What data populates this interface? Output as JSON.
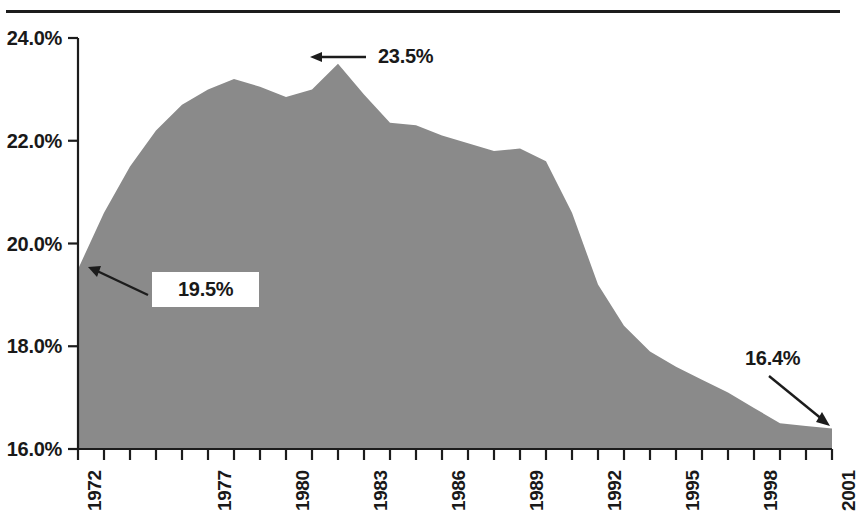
{
  "chart_data": {
    "type": "area",
    "title": "",
    "subtitle": "",
    "xlabel": "",
    "ylabel": "",
    "ylim": [
      16.0,
      24.0
    ],
    "xlim": [
      1972,
      2001
    ],
    "grid": false,
    "legend": null,
    "y_tick_labels": [
      "24.0%",
      "22.0%",
      "20.0%",
      "18.0%",
      "16.0%"
    ],
    "y_tick_values": [
      24.0,
      22.0,
      20.0,
      18.0,
      16.0
    ],
    "x_tick_labels_shown": [
      "1972",
      "1977",
      "1980",
      "1983",
      "1986",
      "1989",
      "1992",
      "1995",
      "1998",
      "2001"
    ],
    "x_tick_values_shown": [
      1972,
      1977,
      1980,
      1983,
      1986,
      1989,
      1992,
      1995,
      1998,
      2001
    ],
    "x_minor_ticks_every_year": true,
    "x": [
      1972,
      1973,
      1974,
      1975,
      1976,
      1977,
      1978,
      1979,
      1980,
      1981,
      1982,
      1983,
      1984,
      1985,
      1986,
      1987,
      1988,
      1989,
      1990,
      1991,
      1992,
      1993,
      1994,
      1995,
      1996,
      1997,
      1998,
      1999,
      2000,
      2001
    ],
    "values": [
      19.5,
      20.6,
      21.5,
      22.2,
      22.7,
      23.0,
      23.2,
      23.05,
      22.85,
      23.0,
      23.5,
      22.9,
      22.35,
      22.3,
      22.1,
      21.95,
      21.8,
      21.85,
      21.6,
      20.6,
      19.2,
      18.4,
      17.9,
      17.6,
      17.35,
      17.1,
      16.8,
      16.5,
      16.45,
      16.4
    ],
    "series_name": "",
    "area_color": "#8a8a8a",
    "annotations": [
      {
        "label": "23.5%",
        "x": 1982,
        "y": 23.5,
        "arrow": "left",
        "boxed": false
      },
      {
        "label": "19.5%",
        "x": 1972,
        "y": 19.5,
        "arrow": "up-left",
        "boxed": true
      },
      {
        "label": "16.4%",
        "x": 2001,
        "y": 16.4,
        "arrow": "down-right",
        "boxed": false
      }
    ]
  },
  "colors": {
    "area_fill": "#8a8a8a",
    "axis": "#1c1c1c",
    "text": "#191919",
    "background": "#ffffff"
  }
}
